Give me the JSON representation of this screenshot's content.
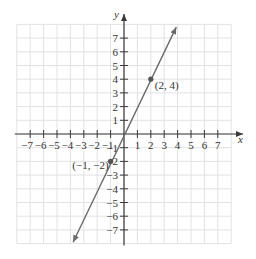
{
  "chart_data": {
    "type": "line",
    "title": "",
    "xlabel": "x",
    "ylabel": "y",
    "xlim": [
      -8,
      8
    ],
    "ylim": [
      -8,
      8
    ],
    "grid": true,
    "x_ticks": [
      -7,
      -6,
      -5,
      -4,
      -3,
      -2,
      -1,
      1,
      2,
      3,
      4,
      5,
      6,
      7
    ],
    "y_ticks": [
      7,
      6,
      5,
      4,
      3,
      2,
      1,
      -1,
      -2,
      -3,
      -4,
      -5,
      -6,
      -7
    ],
    "x_tick_labels": [
      "−7",
      "−6",
      "−5",
      "−4",
      "−3",
      "−2",
      "−1",
      "1",
      "2",
      "3",
      "4",
      "5",
      "6",
      "7"
    ],
    "y_tick_labels": [
      "7",
      "6",
      "5",
      "4",
      "3",
      "2",
      "1",
      "−1",
      "−2",
      "−3",
      "−4",
      "−5",
      "−6",
      "−7"
    ],
    "series": [
      {
        "name": "y = 2x",
        "equation": "y = 2x",
        "x": [
          -3.8,
          3.9
        ],
        "y": [
          -7.9,
          7.8
        ],
        "arrows_both_ends": true
      }
    ],
    "points": [
      {
        "x": 2,
        "y": 4,
        "label": "(2, 4)"
      },
      {
        "x": -1,
        "y": -2,
        "label": "(−1, −2)"
      }
    ],
    "colors": {
      "line": "#6b6b6b",
      "axis": "#3a3a3a",
      "grid": "#e2e2e2",
      "point": "#555555"
    }
  }
}
